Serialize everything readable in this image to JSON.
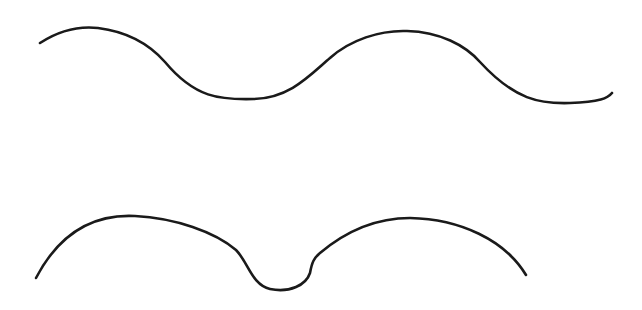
{
  "figure": {
    "background": "#ffffff",
    "stroke_color": "#1a1a1a",
    "curves": [
      {
        "name": "wave-curve",
        "description": "sinusoidal wave with two crests and two troughs"
      },
      {
        "name": "double-arch-curve",
        "description": "two arches joined by a small U-shaped dip"
      }
    ]
  }
}
